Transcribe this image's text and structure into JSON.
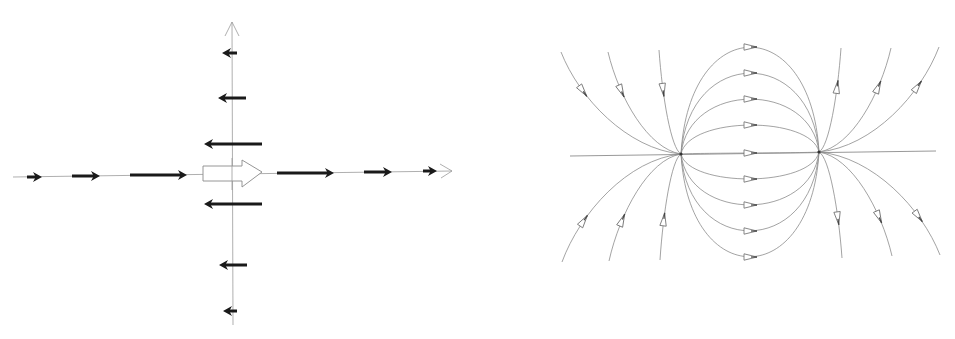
{
  "figure": {
    "panels": [
      {
        "id": "left",
        "description": "Vector field around a dipole along axes",
        "axes": {
          "horizontal": {
            "x1": 13,
            "y": 174,
            "x2": 452,
            "arrowhead": "open"
          },
          "vertical": {
            "x": 232,
            "y1": 325,
            "y2": 22,
            "arrowhead": "open"
          }
        },
        "dipole_arrow": {
          "x1": 203,
          "x2": 262,
          "y": 174,
          "shaft_half_height": 6,
          "head_half_height": 14,
          "head_start": 242,
          "style": "hollow"
        },
        "horizontal_vectors": [
          {
            "x1": 27,
            "x2": 42,
            "y": 177,
            "direction": "right"
          },
          {
            "x1": 72,
            "x2": 100,
            "y": 176,
            "direction": "right"
          },
          {
            "x1": 130,
            "x2": 187,
            "y": 175,
            "direction": "right"
          },
          {
            "x1": 277,
            "x2": 334,
            "y": 173,
            "direction": "right"
          },
          {
            "x1": 364,
            "x2": 392,
            "y": 172,
            "direction": "right"
          },
          {
            "x1": 423,
            "x2": 437,
            "y": 171,
            "direction": "right"
          }
        ],
        "vertical_axis_vectors": [
          {
            "x_tail": 237,
            "x_head": 222,
            "y": 53,
            "direction": "left"
          },
          {
            "x_tail": 246,
            "x_head": 218,
            "y": 98,
            "direction": "left"
          },
          {
            "x_tail": 262,
            "x_head": 204,
            "y": 144,
            "direction": "left"
          },
          {
            "x_tail": 262,
            "x_head": 204,
            "y": 204,
            "direction": "left"
          },
          {
            "x_tail": 247,
            "x_head": 219,
            "y": 265,
            "direction": "left"
          },
          {
            "x_tail": 237,
            "x_head": 223,
            "y": 311,
            "direction": "left"
          }
        ],
        "colors": {
          "vector": "#1a1a1a",
          "axis": "#9a9a9a"
        }
      },
      {
        "id": "right",
        "description": "Field lines of a dipole pair",
        "poles": [
          {
            "name": "left-pole",
            "x": 681,
            "y": 154
          },
          {
            "name": "right-pole",
            "x": 819,
            "y": 152
          }
        ],
        "axis_line": {
          "x1": 570,
          "x2": 936
        },
        "inner_loops_offsets": [
          -106,
          -80,
          -54,
          -28,
          0,
          26,
          52,
          78,
          104
        ],
        "outer_lines_left": [
          {
            "end_x": 561,
            "end_y": 52,
            "side": "top"
          },
          {
            "end_x": 608,
            "end_y": 52,
            "side": "top"
          },
          {
            "end_x": 659,
            "end_y": 50,
            "side": "top"
          },
          {
            "end_x": 562,
            "end_y": 262,
            "side": "bottom"
          },
          {
            "end_x": 609,
            "end_y": 261,
            "side": "bottom"
          },
          {
            "end_x": 660,
            "end_y": 260,
            "side": "bottom"
          }
        ],
        "outer_lines_right": [
          {
            "end_x": 841,
            "end_y": 48,
            "side": "top"
          },
          {
            "end_x": 891,
            "end_y": 48,
            "side": "top"
          },
          {
            "end_x": 939,
            "end_y": 47,
            "side": "top"
          },
          {
            "end_x": 842,
            "end_y": 258,
            "side": "bottom"
          },
          {
            "end_x": 892,
            "end_y": 256,
            "side": "bottom"
          },
          {
            "end_x": 940,
            "end_y": 255,
            "side": "bottom"
          }
        ],
        "colors": {
          "line": "#8c8c8c",
          "arrow": "#6a6a6a"
        }
      }
    ]
  }
}
